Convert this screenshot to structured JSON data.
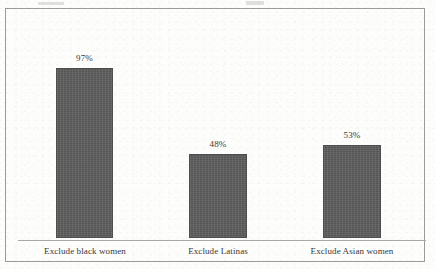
{
  "chart_data": {
    "type": "bar",
    "title": "",
    "subtitle": "",
    "xlabel": "",
    "ylabel": "",
    "grid": false,
    "legend": false,
    "ylim": [
      0,
      100
    ],
    "categories": [
      "Exclude black women",
      "Exclude Latinas",
      "Exclude Asian women"
    ],
    "values": [
      97,
      48,
      53
    ],
    "value_labels": [
      "97%",
      "48%",
      "53%"
    ],
    "series": [
      {
        "name": "",
        "values": [
          97,
          48,
          53
        ]
      }
    ]
  },
  "style": {
    "bar_color": "#5e5e5e",
    "bar_edge_color": "#4e4e4e",
    "background_color": "#fdfdfb",
    "frame_color": "#9b9b98",
    "axis_color": "#a8a8a5",
    "label_color": "#38383a"
  }
}
